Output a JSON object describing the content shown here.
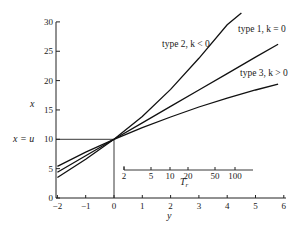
{
  "chart_data": {
    "type": "line",
    "title": "",
    "xlabel": "y",
    "ylabel": "x",
    "xlim": [
      -2,
      6
    ],
    "ylim": [
      0,
      30
    ],
    "x_ticks": [
      "-2",
      "-1",
      "0",
      "1",
      "2",
      "3",
      "4",
      "5",
      "6"
    ],
    "y_ticks": [
      "0",
      "5",
      "10",
      "15",
      "20",
      "25",
      "30"
    ],
    "grid": false,
    "reference": {
      "label": "x = u",
      "x": 0,
      "y": 10
    },
    "secondary_axis": {
      "label": "T_r",
      "ticks": [
        "2",
        "5",
        "10",
        "20",
        "50",
        "100"
      ]
    },
    "series": [
      {
        "name": "type 2, k < 0",
        "x": [
          -2,
          -1,
          0,
          1,
          2,
          3,
          4,
          4.5
        ],
        "y": [
          3.5,
          6.6,
          10,
          13.9,
          18.5,
          23.8,
          29.5,
          31.5
        ]
      },
      {
        "name": "type 1, k = 0",
        "x": [
          -2,
          -1,
          0,
          1,
          2,
          3,
          4,
          5,
          5.8
        ],
        "y": [
          4.4,
          7.2,
          10,
          12.8,
          15.6,
          18.4,
          21.2,
          24,
          26.2
        ]
      },
      {
        "name": "type 3, k > 0",
        "x": [
          -2,
          -1,
          0,
          1,
          2,
          3,
          4,
          5,
          5.8
        ],
        "y": [
          5.4,
          7.8,
          10,
          12.0,
          13.8,
          15.5,
          17.0,
          18.4,
          19.4
        ]
      }
    ]
  },
  "labels": {
    "type2": "type 2, k < 0",
    "type1": "type 1, k = 0",
    "type3": "type 3, k > 0",
    "xlabel": "y",
    "ylabel": "x",
    "xu": "x = u",
    "tr": "T",
    "tr_sub": "r"
  }
}
